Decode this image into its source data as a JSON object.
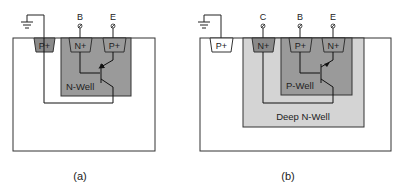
{
  "colors": {
    "substrate": "#ffffff",
    "outline": "#333333",
    "well": "#9a9a9a",
    "deep_well": "#d4d4d4",
    "implant_dark": "#8a8a8a",
    "implant_light": "#ffffff"
  },
  "diagram_a": {
    "caption": "(a)",
    "ground_contact": "P+",
    "well_label": "N-Well",
    "terminals": [
      {
        "name": "B",
        "implant": "N+"
      },
      {
        "name": "E",
        "implant": "P+"
      }
    ]
  },
  "diagram_b": {
    "caption": "(b)",
    "ground_contact": "P+",
    "deep_well_label": "Deep N-Well",
    "well_label": "P-Well",
    "terminals": [
      {
        "name": "C",
        "implant": "N+"
      },
      {
        "name": "B",
        "implant": "P+"
      },
      {
        "name": "E",
        "implant": "N+"
      }
    ]
  }
}
